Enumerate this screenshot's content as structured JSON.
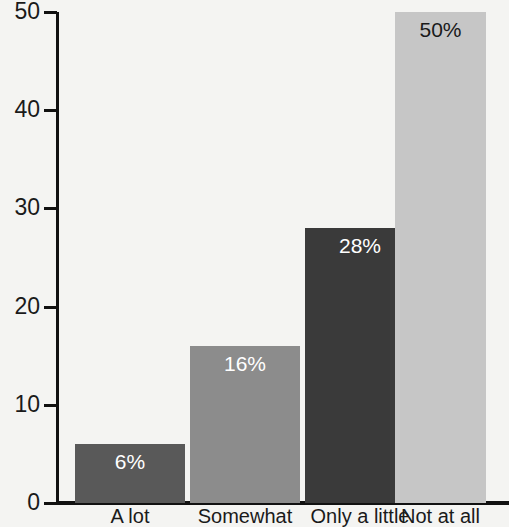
{
  "chart_data": {
    "type": "bar",
    "title": "",
    "subtitle": "",
    "xlabel": "",
    "ylabel": "",
    "categories": [
      "A lot",
      "Somewhat",
      "Only a little",
      "Not at all"
    ],
    "values": [
      6,
      16,
      28,
      50
    ],
    "data_labels": [
      "6%",
      "16%",
      "28%",
      "50%"
    ],
    "bar_colors": [
      "#595959",
      "#8c8c8c",
      "#3a3a3a",
      "#c6c6c6"
    ],
    "data_label_colors": [
      "#ffffff",
      "#ffffff",
      "#ffffff",
      "#1a1a1a"
    ],
    "ylim": [
      0,
      50
    ],
    "yticks": [
      0,
      10,
      20,
      30,
      40,
      50
    ],
    "ytick_labels": [
      "0",
      "10",
      "20",
      "30",
      "40",
      "50"
    ],
    "grid": false,
    "legend": false,
    "legend_position": "none",
    "background_color": "#f4f4f2",
    "axis_color": "#111111"
  },
  "axes": {
    "y": {
      "ticks": [
        {
          "label": "50",
          "value": 50
        },
        {
          "label": "40",
          "value": 40
        },
        {
          "label": "30",
          "value": 30
        },
        {
          "label": "20",
          "value": 20
        },
        {
          "label": "10",
          "value": 10
        },
        {
          "label": "0",
          "value": 0
        }
      ]
    },
    "x": {
      "ticks": [
        {
          "label": "A lot"
        },
        {
          "label": "Somewhat"
        },
        {
          "label": "Only a little"
        },
        {
          "label": "Not at all"
        }
      ]
    }
  }
}
